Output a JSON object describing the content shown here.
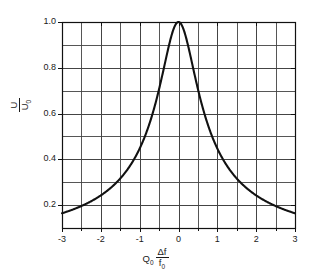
{
  "chart_data": {
    "type": "line",
    "title": "",
    "subtitle": "",
    "xlabel": "Q₀ Δf / f₀",
    "ylabel": "U / U₀",
    "xlabel_parts": {
      "symbol": "Q",
      "symbol_sub": "0",
      "numerator": "Δf",
      "denominator": "f",
      "denominator_sub": "0"
    },
    "ylabel_parts": {
      "numerator": "U",
      "denominator": "U",
      "denominator_sub": "0"
    },
    "xlim": [
      -3,
      3
    ],
    "ylim": [
      0.1,
      1.0
    ],
    "grid": true,
    "grid_x_step": 0.5,
    "grid_y_step": 0.1,
    "legend": "none",
    "xticks": [
      -3,
      -2,
      -1,
      0,
      1,
      2,
      3
    ],
    "xtick_labels": [
      "-3",
      "-2",
      "-1",
      "0",
      "1",
      "2",
      "3"
    ],
    "xticks_minor": [
      -2.5,
      -1.5,
      -0.5,
      0.5,
      1.5,
      2.5
    ],
    "yticks": [
      0.2,
      0.4,
      0.6,
      0.8,
      1.0
    ],
    "ytick_labels": [
      "0.2",
      "0.4",
      "0.6",
      "0.8",
      "1.0"
    ],
    "yticks_minor": [
      0.1,
      0.3,
      0.5,
      0.7,
      0.9
    ],
    "curve_color": "#111111",
    "grid_color": "#444444",
    "axis_color": "#111111",
    "background_color": "#ffffff",
    "series": [
      {
        "name": "U/U0 resonance response",
        "formula": "1 / sqrt(1 + 4 x^2)",
        "x": [
          -3.0,
          -2.8,
          -2.6,
          -2.4,
          -2.2,
          -2.0,
          -1.8,
          -1.6,
          -1.4,
          -1.2,
          -1.0,
          -0.9,
          -0.8,
          -0.7,
          -0.6,
          -0.5,
          -0.4,
          -0.3,
          -0.2,
          -0.1,
          0.0,
          0.1,
          0.2,
          0.3,
          0.4,
          0.5,
          0.6,
          0.7,
          0.8,
          0.9,
          1.0,
          1.2,
          1.4,
          1.6,
          1.8,
          2.0,
          2.2,
          2.4,
          2.6,
          2.8,
          3.0
        ],
        "values": [
          0.164,
          0.176,
          0.189,
          0.205,
          0.223,
          0.243,
          0.268,
          0.298,
          0.336,
          0.383,
          0.447,
          0.486,
          0.53,
          0.581,
          0.64,
          0.707,
          0.781,
          0.857,
          0.928,
          0.981,
          1.0,
          0.981,
          0.928,
          0.857,
          0.781,
          0.707,
          0.64,
          0.581,
          0.53,
          0.486,
          0.447,
          0.383,
          0.336,
          0.298,
          0.268,
          0.243,
          0.223,
          0.205,
          0.189,
          0.176,
          0.164
        ]
      }
    ]
  }
}
